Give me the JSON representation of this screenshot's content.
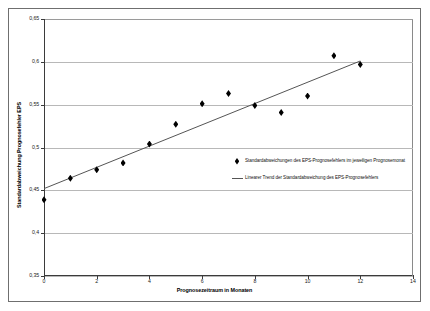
{
  "chart_data": {
    "type": "scatter",
    "title": "",
    "xlabel": "Prognosezeitraum in Monaten",
    "ylabel": "Standardabweichung Prognosefehler EPS",
    "xlim": [
      0,
      14
    ],
    "ylim": [
      0.35,
      0.65
    ],
    "xticks": [
      "0",
      "2",
      "4",
      "6",
      "8",
      "10",
      "12",
      "14"
    ],
    "xtick_values": [
      0,
      2,
      4,
      6,
      8,
      10,
      12,
      14
    ],
    "yticks": [
      "0,35",
      "0,4",
      "0,45",
      "0,5",
      "0,55",
      "0,6",
      "0,65"
    ],
    "ytick_values": [
      0.35,
      0.4,
      0.45,
      0.5,
      0.55,
      0.6,
      0.65
    ],
    "grid": true,
    "grid_axis": "y",
    "legend_position": "center-right",
    "series": [
      {
        "name": "Standardabweichungen des EPS-Prognosefehlers im jeweiligen Prognosemonat",
        "type": "scatter",
        "marker": "diamond",
        "color": "#000000",
        "x": [
          0,
          1,
          2,
          3,
          4,
          5,
          6,
          7,
          8,
          9,
          10,
          11,
          12
        ],
        "values": [
          0.439,
          0.464,
          0.474,
          0.482,
          0.504,
          0.527,
          0.551,
          0.563,
          0.549,
          0.541,
          0.56,
          0.607,
          0.597
        ]
      },
      {
        "name": "Linearer Trend der Standardabweichung des EPS-Prognosefehlers",
        "type": "line",
        "color": "#555555",
        "x": [
          0,
          12
        ],
        "values": [
          0.452,
          0.601
        ]
      }
    ]
  },
  "legend": {
    "items": [
      {
        "key": "diamond-marker-icon",
        "label": "Standardabweichungen des EPS-Prognosefehlers im jeweiligen Prognosemonat"
      },
      {
        "key": "trend-line-icon",
        "label": "Linearer Trend der Standardabweichung des EPS-Prognosefehlers"
      }
    ]
  },
  "colors": {
    "marker": "#000000",
    "trend_line": "#555555",
    "gridline": "#b8b8b8",
    "axis": "#3b3b3b",
    "frame": "#6f6f6f",
    "background": "#ffffff"
  }
}
